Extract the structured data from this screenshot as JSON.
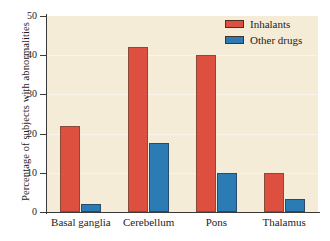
{
  "chart_data": {
    "type": "bar",
    "title": "",
    "xlabel": "",
    "ylabel": "Percentage of subjects with abnormalities",
    "categories": [
      "Basal ganglia",
      "Cerebellum",
      "Pons",
      "Thalamus"
    ],
    "series": [
      {
        "name": "Inhalants",
        "color": "#dd4f3f",
        "values": [
          22,
          42,
          40,
          10
        ]
      },
      {
        "name": "Other drugs",
        "color": "#2b7cb5",
        "values": [
          2,
          17.7,
          10,
          3.4
        ]
      }
    ],
    "ylim": [
      0,
      50
    ],
    "yticks": [
      0,
      10,
      20,
      30,
      40,
      50
    ],
    "ytick_labels": [
      "0",
      "10",
      "20",
      "30",
      "40",
      "50"
    ],
    "grid": true,
    "legend_position": "top-right",
    "plot_background": "#f5ecd7",
    "figure_background": "#ffffff",
    "axis_color": "#3a3a3a"
  }
}
